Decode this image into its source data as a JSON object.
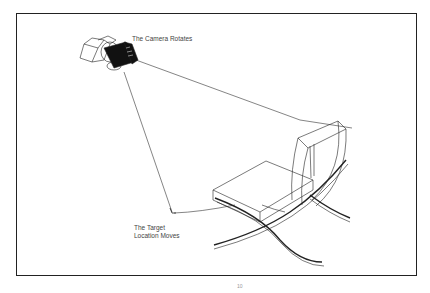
{
  "diagram": {
    "labels": {
      "camera": "The Camera Rotates",
      "target_line1": "The Target",
      "target_line2": "Location Moves"
    },
    "elements": [
      "camera",
      "sightline-to-chair",
      "sightline-to-target",
      "target-marker",
      "chair-wireframe"
    ],
    "colors": {
      "line": "#222222",
      "text": "#444444",
      "background": "#ffffff"
    },
    "footer_mark": "10"
  }
}
